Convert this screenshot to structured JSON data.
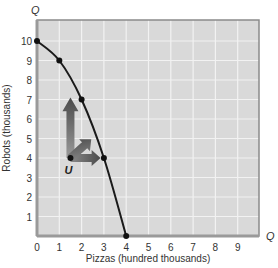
{
  "chart_data": {
    "type": "line",
    "title": "",
    "xlabel": "Pizzas (hundred thousands)",
    "ylabel": "Robots (thousands)",
    "x_axis_symbol": "Q",
    "y_axis_symbol": "Q",
    "xlim": [
      0,
      10
    ],
    "ylim": [
      0,
      11
    ],
    "x_ticks": [
      "0",
      "1",
      "2",
      "3",
      "4",
      "5",
      "6",
      "7",
      "8",
      "9"
    ],
    "y_ticks": [
      "1",
      "2",
      "3",
      "4",
      "5",
      "6",
      "7",
      "8",
      "9",
      "10"
    ],
    "grid": true,
    "series": [
      {
        "name": "Production possibilities frontier",
        "x": [
          0,
          1,
          2,
          3,
          4
        ],
        "y": [
          10,
          9,
          7,
          4,
          0
        ],
        "color": "#1a1a1a"
      }
    ],
    "points": [
      {
        "label": "U",
        "x": 1.5,
        "y": 4
      }
    ],
    "annotations": [
      {
        "type": "arrow",
        "from": [
          1.5,
          4
        ],
        "direction": "up",
        "to": [
          1.5,
          7
        ]
      },
      {
        "type": "arrow",
        "from": [
          1.5,
          4
        ],
        "direction": "up-right",
        "to": [
          2.3,
          5
        ]
      },
      {
        "type": "arrow",
        "from": [
          1.5,
          4
        ],
        "direction": "right",
        "to": [
          2.8,
          4
        ]
      }
    ],
    "colors": {
      "plot_background": "#d9d9d9",
      "grid": "#f2f2f2",
      "frame": "#8a8a8a",
      "curve": "#1a1a1a",
      "arrow": "#6e6e6e"
    }
  }
}
